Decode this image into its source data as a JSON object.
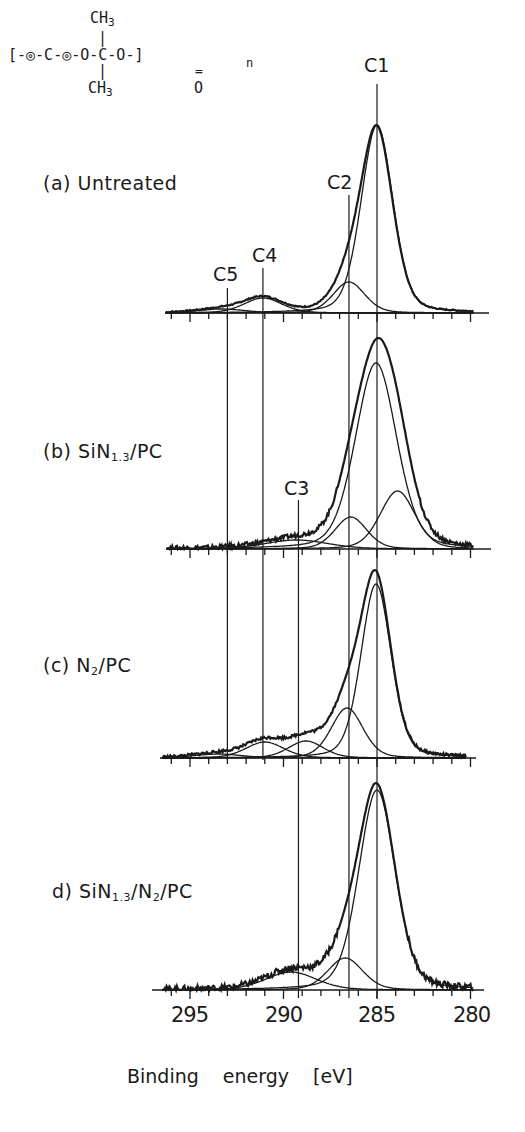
{
  "figure": {
    "formula": {
      "top": "CH3",
      "main": "[-◎-C-◎-O-C-O-]",
      "subscript_n": "n",
      "bottom_left": "CH3",
      "bottom_right": "O"
    },
    "caption_fragment": "Figure 7"
  },
  "chart_data": {
    "type": "line",
    "xlabel": "Binding energy [eV]",
    "ylabel": "",
    "xlim": [
      297,
      279.5
    ],
    "x_reversed": true,
    "x_ticks": [
      295,
      290,
      285,
      280
    ],
    "x_tick_labels": [
      "295",
      "290",
      "285",
      "280"
    ],
    "minor_tick_step_eV": 1,
    "grid": false,
    "peak_lines": [
      {
        "name": "C1",
        "energy_eV": 285.0
      },
      {
        "name": "C2",
        "energy_eV": 286.5
      },
      {
        "name": "C3",
        "energy_eV": 289.2
      },
      {
        "name": "C4",
        "energy_eV": 291.1
      },
      {
        "name": "C5",
        "energy_eV": 293.0
      }
    ],
    "panels": [
      {
        "label": "(a) Untreated",
        "envelope_peak_height": 188,
        "components": [
          {
            "name": "C1",
            "center_eV": 285.0,
            "height": 188,
            "fwhm_eV": 2.0
          },
          {
            "name": "C2",
            "center_eV": 286.5,
            "height": 31,
            "fwhm_eV": 2.0
          },
          {
            "name": "C4",
            "center_eV": 291.1,
            "height": 15,
            "fwhm_eV": 2.4
          },
          {
            "name": "C5",
            "center_eV": 293.3,
            "height": 4,
            "fwhm_eV": 3.0
          }
        ]
      },
      {
        "label": "(b) SiN1.3/PC",
        "envelope_peak_height": 211,
        "components": [
          {
            "name": "C1",
            "center_eV": 285.05,
            "height": 186,
            "fwhm_eV": 2.6
          },
          {
            "name": "C2",
            "center_eV": 286.4,
            "height": 32,
            "fwhm_eV": 2.0
          },
          {
            "name": "C-low",
            "center_eV": 283.9,
            "height": 58,
            "fwhm_eV": 2.2
          },
          {
            "name": "C3",
            "center_eV": 289.3,
            "height": 9,
            "fwhm_eV": 4.0
          }
        ]
      },
      {
        "label": "(c) N2/PC",
        "envelope_peak_height": 188,
        "components": [
          {
            "name": "C1",
            "center_eV": 285.05,
            "height": 174,
            "fwhm_eV": 1.9
          },
          {
            "name": "C2",
            "center_eV": 286.6,
            "height": 50,
            "fwhm_eV": 2.0
          },
          {
            "name": "C3",
            "center_eV": 288.8,
            "height": 17,
            "fwhm_eV": 2.2
          },
          {
            "name": "C4",
            "center_eV": 291.0,
            "height": 16,
            "fwhm_eV": 2.4
          },
          {
            "name": "C5",
            "center_eV": 293.5,
            "height": 4,
            "fwhm_eV": 3.0
          }
        ]
      },
      {
        "label": "d) SiN1.3/N2/PC",
        "envelope_peak_height": 207,
        "components": [
          {
            "name": "C1",
            "center_eV": 285.0,
            "height": 200,
            "fwhm_eV": 2.3
          },
          {
            "name": "C2",
            "center_eV": 286.7,
            "height": 32,
            "fwhm_eV": 2.2
          },
          {
            "name": "C3",
            "center_eV": 289.6,
            "height": 18,
            "fwhm_eV": 3.2
          }
        ]
      }
    ]
  },
  "labels": {
    "panel_a": "(a) Untreated",
    "panel_b_prefix": "(b) SiN",
    "panel_b_sub": "1.3",
    "panel_b_suffix": "/PC",
    "panel_c_prefix": "(c) N",
    "panel_c_sub": "2",
    "panel_c_suffix": "/PC",
    "panel_d_prefix": "d) SiN",
    "panel_d_sub1": "1.3",
    "panel_d_mid": "/N",
    "panel_d_sub2": "2",
    "panel_d_suffix": "/PC",
    "C1": "C1",
    "C2": "C2",
    "C3": "C3",
    "C4": "C4",
    "C5": "C5",
    "tick_295": "295",
    "tick_290": "290",
    "tick_285": "285",
    "tick_280": "280",
    "xlabel": "Binding energy [eV]"
  }
}
